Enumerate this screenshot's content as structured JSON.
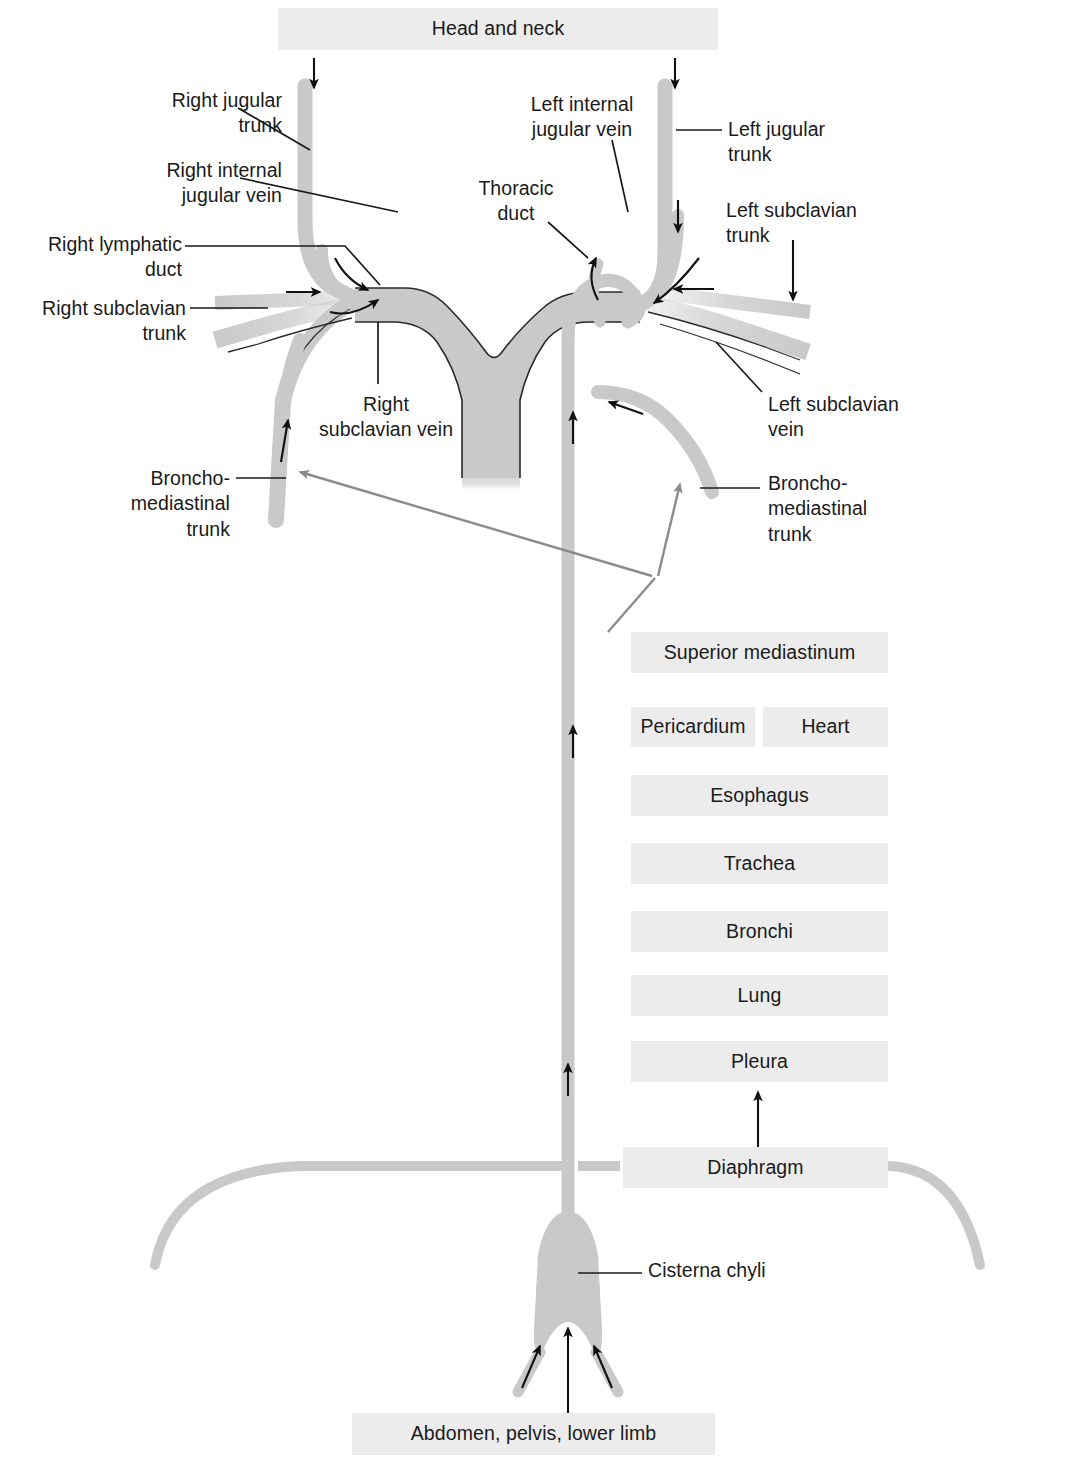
{
  "diagram": {
    "colors": {
      "box_fill": "#ececec",
      "vessel_gray": "#c9c9c9",
      "vessel_gray_dark": "#b9b9b9",
      "outline": "#1a1a1a",
      "arrow_black": "#111111",
      "arrow_gray": "#8b8b8b",
      "text": "#1a1a1a",
      "background": "#ffffff"
    },
    "region_boxes": [
      {
        "id": "head-and-neck",
        "label": "Head and neck",
        "x": 278,
        "y": 8,
        "w": 440,
        "h": 42
      },
      {
        "id": "superior-mediastinum",
        "label": "Superior mediastinum",
        "x": 631,
        "y": 632,
        "w": 257,
        "h": 41
      },
      {
        "id": "pericardium",
        "label": "Pericardium",
        "x": 631,
        "y": 707,
        "w": 124,
        "h": 40
      },
      {
        "id": "heart",
        "label": "Heart",
        "x": 763,
        "y": 707,
        "w": 125,
        "h": 40
      },
      {
        "id": "esophagus",
        "label": "Esophagus",
        "x": 631,
        "y": 775,
        "w": 257,
        "h": 41
      },
      {
        "id": "trachea",
        "label": "Trachea",
        "x": 631,
        "y": 843,
        "w": 257,
        "h": 41
      },
      {
        "id": "bronchi",
        "label": "Bronchi",
        "x": 631,
        "y": 911,
        "w": 257,
        "h": 41
      },
      {
        "id": "lung",
        "label": "Lung",
        "x": 631,
        "y": 975,
        "w": 257,
        "h": 41
      },
      {
        "id": "pleura",
        "label": "Pleura",
        "x": 631,
        "y": 1041,
        "w": 257,
        "h": 41
      },
      {
        "id": "diaphragm",
        "label": "Diaphragm",
        "x": 623,
        "y": 1147,
        "w": 265,
        "h": 41
      },
      {
        "id": "abdomen-pelvis-lower-limb",
        "label": "Abdomen, pelvis, lower limb",
        "x": 352,
        "y": 1413,
        "w": 363,
        "h": 42
      }
    ],
    "labels": [
      {
        "id": "right-jugular-trunk",
        "text": "Right jugular\ntrunk",
        "x": 98,
        "y": 88,
        "w": 184,
        "align": "right"
      },
      {
        "id": "right-internal-jugular-vein",
        "text": "Right internal\njugular vein",
        "x": 88,
        "y": 158,
        "w": 194,
        "align": "right"
      },
      {
        "id": "right-lymphatic-duct",
        "text": "Right lymphatic\nduct",
        "x": 22,
        "y": 232,
        "w": 160,
        "align": "right"
      },
      {
        "id": "right-subclavian-trunk",
        "text": "Right subclavian\ntrunk",
        "x": 22,
        "y": 296,
        "w": 164,
        "align": "right"
      },
      {
        "id": "left-internal-jugular-vein",
        "text": "Left internal\njugular vein",
        "x": 512,
        "y": 92,
        "w": 132,
        "align": "left"
      },
      {
        "id": "thoracic-duct",
        "text": "Thoracic\nduct",
        "x": 466,
        "y": 176,
        "w": 100,
        "align": "left"
      },
      {
        "id": "left-jugular-trunk",
        "text": "Left jugular\ntrunk",
        "x": 728,
        "y": 117,
        "w": 130,
        "align": "left"
      },
      {
        "id": "left-subclavian-trunk",
        "text": "Left subclavian\ntrunk",
        "x": 726,
        "y": 198,
        "w": 160,
        "align": "left"
      },
      {
        "id": "right-subclavian-vein",
        "text": "Right\nsubclavian vein",
        "x": 300,
        "y": 392,
        "w": 172,
        "align": "center"
      },
      {
        "id": "left-subclavian-vein",
        "text": "Left subclavian\nvein",
        "x": 768,
        "y": 392,
        "w": 160,
        "align": "left"
      },
      {
        "id": "broncho-mediastinal-trunk-right",
        "text": "Broncho-\nmediastinal\ntrunk",
        "x": 100,
        "y": 466,
        "w": 130,
        "align": "right"
      },
      {
        "id": "broncho-mediastinal-trunk-left",
        "text": "Broncho-\nmediastinal\ntrunk",
        "x": 768,
        "y": 471,
        "w": 150,
        "align": "left"
      },
      {
        "id": "cisterna-chyli",
        "text": "Cisterna chyli",
        "x": 648,
        "y": 1258,
        "w": 140,
        "align": "left"
      }
    ],
    "flow_arrows": [
      {
        "id": "arrow-head-neck-right-in",
        "direction": "down",
        "x": 314,
        "y": 58,
        "len": 30
      },
      {
        "id": "arrow-head-neck-left-in",
        "direction": "down",
        "x": 675,
        "y": 58,
        "len": 30
      },
      {
        "id": "arrow-left-jugular-down",
        "direction": "down",
        "x": 678,
        "y": 200,
        "len": 30
      },
      {
        "id": "arrow-left-subclavian-trunk-down",
        "direction": "down",
        "x": 793,
        "y": 240,
        "len": 58
      },
      {
        "id": "arrow-right-subclavian-in",
        "direction": "right",
        "x": 286,
        "y": 292,
        "len": 32
      },
      {
        "id": "arrow-left-subclavian-in",
        "direction": "left",
        "x": 674,
        "y": 289,
        "len": 40
      },
      {
        "id": "arrow-thoracic-duct-1",
        "direction": "up",
        "x": 573,
        "y": 412,
        "len": 32
      },
      {
        "id": "arrow-thoracic-duct-2",
        "direction": "up",
        "x": 573,
        "y": 726,
        "len": 32
      },
      {
        "id": "arrow-thoracic-duct-3",
        "direction": "up",
        "x": 568,
        "y": 1064,
        "len": 32
      },
      {
        "id": "arrow-bmt-right-up",
        "direction": "up",
        "x": 285,
        "y": 420,
        "len": 42
      },
      {
        "id": "arrow-bmt-left-up",
        "direction": "left",
        "x": 613,
        "y": 406,
        "len": 30
      },
      {
        "id": "arrow-pleura-up",
        "direction": "up",
        "x": 758,
        "y": 1092,
        "len": 55
      },
      {
        "id": "arrow-abdomen-up",
        "direction": "up",
        "x": 568,
        "y": 1330,
        "len": 85
      },
      {
        "id": "arrow-lumbar-right-up",
        "direction": "up",
        "x": 530,
        "y": 1370,
        "len": 48
      },
      {
        "id": "arrow-lumbar-left-up",
        "direction": "up",
        "x": 600,
        "y": 1370,
        "len": 48
      }
    ],
    "gray_pointer_arrows": [
      {
        "id": "gray-arrow-to-right-bmt",
        "from_x": 655,
        "from_y": 578,
        "to_x": 300,
        "to_y": 472
      },
      {
        "id": "gray-arrow-to-left-bmt",
        "from_x": 655,
        "from_y": 578,
        "to_x": 678,
        "to_y": 482
      }
    ]
  }
}
